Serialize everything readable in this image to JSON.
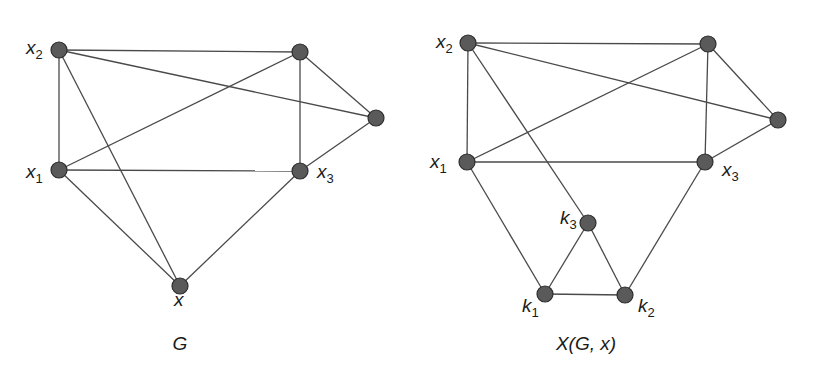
{
  "graphs": [
    {
      "id": "G",
      "caption": "G",
      "caption_pos": [
        180,
        350
      ],
      "nodes": [
        {
          "id": "x2",
          "x": 59,
          "y": 50,
          "label": "x",
          "sub": "2",
          "lx": 26,
          "ly": 54
        },
        {
          "id": "a",
          "x": 300,
          "y": 52,
          "label": "",
          "sub": ""
        },
        {
          "id": "b",
          "x": 376,
          "y": 118,
          "label": "",
          "sub": ""
        },
        {
          "id": "x1",
          "x": 59,
          "y": 170,
          "label": "x",
          "sub": "1",
          "lx": 26,
          "ly": 178
        },
        {
          "id": "x3",
          "x": 300,
          "y": 171,
          "label": "x",
          "sub": "3",
          "lx": 317,
          "ly": 178
        },
        {
          "id": "x",
          "x": 180,
          "y": 286,
          "label": "x",
          "sub": "",
          "lx": 174,
          "ly": 306
        }
      ],
      "edges": [
        [
          "x2",
          "a"
        ],
        [
          "x2",
          "b"
        ],
        [
          "x2",
          "x1"
        ],
        [
          "x2",
          "x"
        ],
        [
          "a",
          "x1"
        ],
        [
          "a",
          "x3"
        ],
        [
          "a",
          "b"
        ],
        [
          "b",
          "x3"
        ],
        [
          "x1",
          "x3"
        ],
        [
          "x1",
          "x"
        ],
        [
          "x3",
          "x"
        ]
      ]
    },
    {
      "id": "XGx",
      "caption": "X(G, x)",
      "caption_pos": [
        586,
        350
      ],
      "nodes": [
        {
          "id": "x2",
          "x": 468,
          "y": 43,
          "label": "x",
          "sub": "2",
          "lx": 436,
          "ly": 48
        },
        {
          "id": "a",
          "x": 708,
          "y": 44,
          "label": "",
          "sub": ""
        },
        {
          "id": "b",
          "x": 778,
          "y": 120,
          "label": "",
          "sub": ""
        },
        {
          "id": "x1",
          "x": 467,
          "y": 162,
          "label": "x",
          "sub": "1",
          "lx": 430,
          "ly": 168
        },
        {
          "id": "x3",
          "x": 705,
          "y": 162,
          "label": "x",
          "sub": "3",
          "lx": 722,
          "ly": 176
        },
        {
          "id": "k3",
          "x": 588,
          "y": 223,
          "label": "k",
          "sub": "3",
          "lx": 560,
          "ly": 224
        },
        {
          "id": "k1",
          "x": 545,
          "y": 294,
          "label": "k",
          "sub": "1",
          "lx": 522,
          "ly": 312
        },
        {
          "id": "k2",
          "x": 625,
          "y": 295,
          "label": "k",
          "sub": "2",
          "lx": 638,
          "ly": 312
        }
      ],
      "edges": [
        [
          "x2",
          "a"
        ],
        [
          "x2",
          "b"
        ],
        [
          "x2",
          "x1"
        ],
        [
          "x2",
          "k3"
        ],
        [
          "a",
          "x1"
        ],
        [
          "a",
          "x3"
        ],
        [
          "a",
          "b"
        ],
        [
          "b",
          "x3"
        ],
        [
          "x1",
          "x3"
        ],
        [
          "x1",
          "k1"
        ],
        [
          "x3",
          "k2"
        ],
        [
          "k3",
          "k1"
        ],
        [
          "k3",
          "k2"
        ],
        [
          "k1",
          "k2"
        ]
      ]
    }
  ],
  "colors": {
    "edge": "#4a4a4a",
    "node_fill": "#5a5a5a",
    "node_stroke": "#2e2e2e",
    "text": "#1a1a1a"
  }
}
